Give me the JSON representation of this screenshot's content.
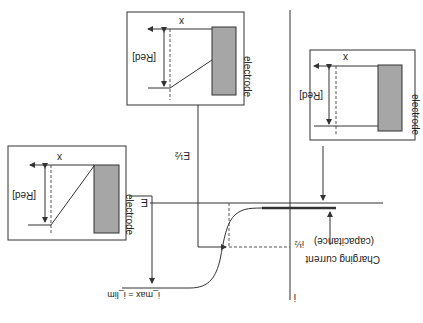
{
  "orientation": "rotated-180",
  "axes": {
    "x_label": "E",
    "y_label": "i"
  },
  "labels": {
    "half_wave_potential": "E½",
    "half_current": "i½",
    "limiting_current": "i_max = i_lim",
    "charging_current_line1": "Charging current",
    "charging_current_line2": "(capacitance)"
  },
  "insets": [
    {
      "name": "inset-top",
      "x_label": "x",
      "y_label": "[Red]",
      "electrode_label": "electrode",
      "profile": "partial-slope"
    },
    {
      "name": "inset-right",
      "x_label": "x",
      "y_label": "[Red]",
      "electrode_label": "electrode",
      "profile": "flat"
    },
    {
      "name": "inset-left",
      "x_label": "x",
      "y_label": "[Red]",
      "electrode_label": "electrode",
      "profile": "full-slope"
    }
  ],
  "colors": {
    "line": "#333333",
    "electrode_fill": "#a6a6a6",
    "dashed": "#555555"
  }
}
